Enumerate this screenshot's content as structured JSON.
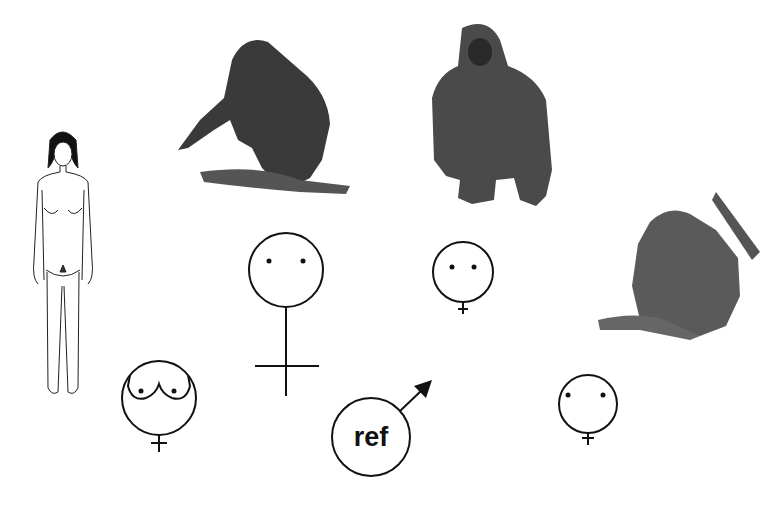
{
  "figure": {
    "type": "comparative-diagram",
    "subjects": [
      {
        "id": "human",
        "label": "human female",
        "icon": "human-female-figure"
      },
      {
        "id": "chimpanzee",
        "label": "chimpanzee",
        "icon": "chimpanzee-figure"
      },
      {
        "id": "gorilla",
        "label": "gorilla",
        "icon": "gorilla-figure"
      },
      {
        "id": "orangutan",
        "label": "orangutan",
        "icon": "orangutan-figure"
      }
    ],
    "symbols": [
      {
        "id": "human-female-symbol",
        "kind": "female",
        "features": "breasts",
        "size": "medium"
      },
      {
        "id": "chimpanzee-female-symbol",
        "kind": "female",
        "features": "eyes",
        "size": "large"
      },
      {
        "id": "gorilla-female-symbol",
        "kind": "female",
        "features": "eyes",
        "size": "small"
      },
      {
        "id": "orangutan-female-symbol",
        "kind": "female",
        "features": "eyes",
        "size": "small"
      },
      {
        "id": "reference-male-symbol",
        "kind": "male",
        "size": "medium"
      }
    ],
    "reference_label": "ref"
  },
  "colors": {
    "ink": "#111111",
    "background": "#ffffff"
  }
}
